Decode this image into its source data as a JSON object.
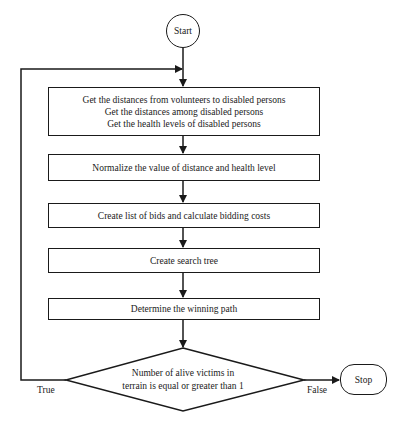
{
  "diagram": {
    "start": {
      "label": "Start"
    },
    "steps": [
      {
        "lines": [
          "Get the distances from volunteers to disabled persons",
          "Get the distances among disabled persons",
          "Get the health levels of disabled persons"
        ]
      },
      {
        "lines": [
          "Normalize the value of distance and health level"
        ]
      },
      {
        "lines": [
          "Create list of bids and calculate bidding costs"
        ]
      },
      {
        "lines": [
          "Create search tree"
        ]
      },
      {
        "lines": [
          "Determine the winning path"
        ]
      }
    ],
    "decision": {
      "lines": [
        "Number of alive victims in",
        "terrain is equal or greater than 1"
      ]
    },
    "branches": {
      "true_label": "True",
      "false_label": "False"
    },
    "stop": {
      "label": "Stop"
    }
  }
}
